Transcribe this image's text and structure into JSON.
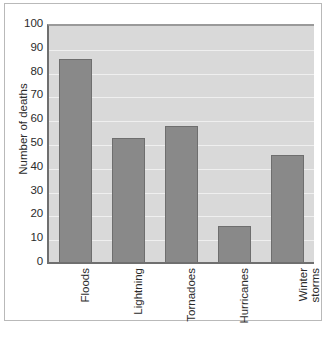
{
  "chart_data": {
    "type": "bar",
    "title": "",
    "xlabel": "",
    "ylabel": "Number of deaths",
    "categories": [
      "Floods",
      "Lightning",
      "Tornadoes",
      "Hurricanes",
      "Winter storms"
    ],
    "values": [
      86,
      53,
      58,
      16,
      46
    ],
    "ylim": [
      0,
      100
    ],
    "y_ticks": [
      0,
      10,
      20,
      30,
      40,
      50,
      60,
      70,
      80,
      90,
      100
    ],
    "y_tick_labels": [
      "0",
      "10",
      "20",
      "30",
      "40",
      "50",
      "60",
      "70",
      "80",
      "90",
      "100"
    ],
    "grid": true,
    "legend": "none",
    "series": [
      {
        "name": "Number of deaths",
        "values": [
          86,
          53,
          58,
          16,
          46
        ]
      }
    ],
    "colors": {
      "bar_fill": "#898989",
      "bar_edge": "#6e6e6e",
      "plot_background": "#d9d9d9",
      "gridline": "#efefef",
      "axis_line": "#6f6f6f",
      "text": "#2b2b2b",
      "figure_background": "#ffffff",
      "figure_frame": "#b9b9b9"
    },
    "category_label_lines": [
      [
        "Floods"
      ],
      [
        "Lightning"
      ],
      [
        "Tornadoes"
      ],
      [
        "Hurricanes"
      ],
      [
        "Winter",
        "storms"
      ]
    ]
  }
}
